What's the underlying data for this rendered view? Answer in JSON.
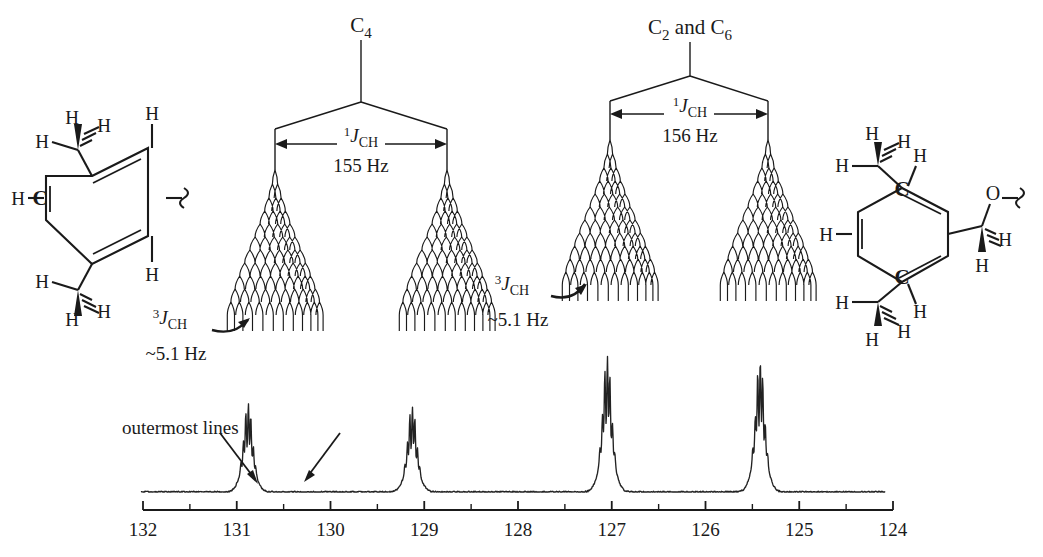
{
  "figure": {
    "type": "nmr-spectrum-with-coupling-trees"
  },
  "axis": {
    "label_left": "132",
    "label_right": "124",
    "ticks": [
      "132",
      "131",
      "130",
      "129",
      "128",
      "127",
      "126",
      "125",
      "124"
    ],
    "values": [
      132,
      131,
      130,
      129,
      128,
      127,
      126,
      125,
      124
    ],
    "minor_ticks": [
      131.5,
      130.5,
      129.5,
      128.5,
      127.5,
      126.5,
      125.5,
      124.5
    ],
    "direction": "decreasing-left-to-right",
    "unit": "ppm"
  },
  "trees": {
    "left": {
      "title": "C",
      "title_sub": "4",
      "j_one_label": "J",
      "j_one_pre": "1",
      "j_one_sub": "CH",
      "j_one_value": "155 Hz",
      "j_three_pre": "3",
      "j_three_label": "J",
      "j_three_sub": "CH",
      "j_three_value": "~5.1 Hz",
      "levels": 12
    },
    "right": {
      "title": "C",
      "title_sub": "2",
      "title_mid": " and C",
      "title_sub2": "6",
      "j_one_label": "J",
      "j_one_pre": "1",
      "j_one_sub": "CH",
      "j_one_value": "156 Hz",
      "j_three_pre": "3",
      "j_three_label": "J",
      "j_three_sub": "CH",
      "j_three_value": "~5.1 Hz",
      "levels": 12
    }
  },
  "annotations": {
    "outermost_lines": "outermost lines"
  },
  "structures": {
    "left": {
      "atoms": [
        "H",
        "H",
        "H",
        "H",
        "C",
        "H",
        "H",
        "H",
        "H",
        "H",
        "H"
      ],
      "labelled_carbon": "C",
      "h_labels": [
        "H",
        "H",
        "H",
        "H",
        "H",
        "H",
        "H",
        "H",
        "H"
      ],
      "squiggle": true
    },
    "right": {
      "labelled_carbons": [
        "C",
        "C"
      ],
      "oxygen": "O",
      "h_labels": [
        "H",
        "H",
        "H",
        "H",
        "H",
        "H",
        "H",
        "H",
        "H",
        "H"
      ],
      "squiggle": true
    }
  },
  "chart_data": {
    "type": "line",
    "title": "",
    "xlabel": "",
    "ylabel": "",
    "xlim": [
      132,
      124
    ],
    "ylim": [
      0,
      1
    ],
    "grid": false,
    "legend": "none",
    "x_tick_labels": [
      "132",
      "131",
      "130",
      "129",
      "128",
      "127",
      "126",
      "125",
      "124"
    ],
    "x_tick_values": [
      132,
      131,
      130,
      129,
      128,
      127,
      126,
      125,
      124
    ],
    "peaks": [
      {
        "name": "C4-left-branch",
        "ppm": 130.88,
        "rel_height": 0.62,
        "assignment": "C4"
      },
      {
        "name": "C4-right-branch",
        "ppm": 129.13,
        "rel_height": 0.6,
        "assignment": "C4"
      },
      {
        "name": "C2C6-left-branch",
        "ppm": 127.05,
        "rel_height": 0.95,
        "assignment": "C2 and C6"
      },
      {
        "name": "C2C6-right-branch",
        "ppm": 125.42,
        "rel_height": 0.93,
        "assignment": "C2 and C6"
      }
    ],
    "couplings": [
      {
        "label": "1J(CH) C4",
        "value": 155,
        "unit": "Hz"
      },
      {
        "label": "1J(CH) C2,C6",
        "value": 156,
        "unit": "Hz"
      },
      {
        "label": "3J(CH) C4",
        "value": 5.1,
        "unit": "Hz",
        "approximate": true
      },
      {
        "label": "3J(CH) C2,C6",
        "value": 5.1,
        "unit": "Hz",
        "approximate": true
      }
    ]
  },
  "colors": {
    "ink": "#1a1a1a",
    "trace": "#222222",
    "background": "#ffffff"
  }
}
